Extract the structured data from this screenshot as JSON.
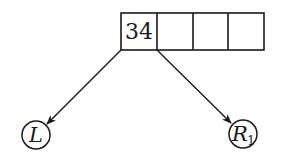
{
  "diagram": {
    "type": "b-tree-node",
    "colors": {
      "stroke": "#1a1a1a",
      "background": "#ffffff"
    },
    "node": {
      "cells": [
        {
          "key": "34"
        },
        {
          "key": ""
        },
        {
          "key": ""
        },
        {
          "key": ""
        }
      ]
    },
    "children": [
      {
        "label": "L",
        "subscript": "",
        "from_pointer": 0
      },
      {
        "label": "R",
        "subscript": "1",
        "from_pointer": 1
      }
    ]
  }
}
